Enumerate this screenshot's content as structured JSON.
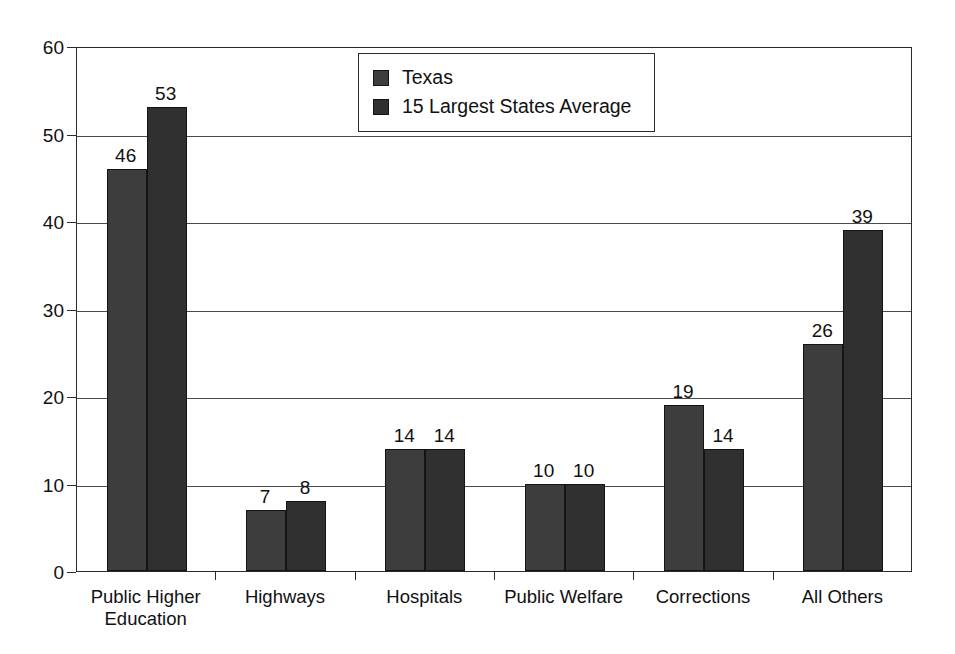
{
  "chart_data": {
    "type": "bar",
    "title": "",
    "subtitle": "",
    "xlabel": "",
    "ylabel": "",
    "ylim": [
      0,
      60
    ],
    "yticks": [
      "0",
      "10",
      "20",
      "30",
      "40",
      "50",
      "60"
    ],
    "ytick_values": [
      0,
      10,
      20,
      30,
      40,
      50,
      60
    ],
    "grid": true,
    "grid_axis": "y",
    "legend_position": "top-center-inside",
    "orientation": "vertical",
    "grouping": "grouped",
    "categories": [
      "Public Higher\nEducation",
      "Highways",
      "Hospitals",
      "Public Welfare",
      "Corrections",
      "All Others"
    ],
    "series": [
      {
        "name": "Texas",
        "color": "#3d3d3d",
        "values": [
          46,
          7,
          14,
          10,
          19,
          26
        ],
        "labels": [
          "46",
          "7",
          "14",
          "10",
          "19",
          "26"
        ]
      },
      {
        "name": "15 Largest States Average",
        "color": "#303030",
        "values": [
          53,
          8,
          14,
          10,
          14,
          39
        ],
        "labels": [
          "53",
          "8",
          "14",
          "10",
          "14",
          "39"
        ]
      }
    ]
  },
  "legend": {
    "entries": [
      {
        "label": "Texas",
        "swatch_color": "#3d3d3d"
      },
      {
        "label": "15 Largest States Average",
        "swatch_color": "#303030"
      }
    ]
  },
  "axes": {
    "y": {
      "min": 0,
      "max": 60,
      "step": 10,
      "tick_labels": [
        "60",
        "50",
        "40",
        "30",
        "20",
        "10",
        "0"
      ]
    },
    "x": {
      "tick_labels": [
        "Public Higher\nEducation",
        "Highways",
        "Hospitals",
        "Public Welfare",
        "Corrections",
        "All Others"
      ]
    }
  },
  "style": {
    "background": "#ffffff",
    "frame_color": "#2b2b2b",
    "gridline_color": "#4a4a4a",
    "text_color": "#111111"
  }
}
